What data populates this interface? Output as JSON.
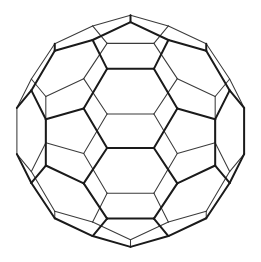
{
  "figure": {
    "name": "truncated-icosahedron-wireframe",
    "background_color": "#ffffff",
    "front_edge_color": "#1a1a1a",
    "back_edge_color": "#3b3b3b",
    "front_edge_width": 2.0,
    "back_edge_width": 1.05,
    "canvas": {
      "width": 261,
      "height": 262
    }
  },
  "geometry": {
    "solid": "truncated icosahedron",
    "vertex_count": 60,
    "edge_count": 90,
    "face_count": 32,
    "hexagon_faces": 20,
    "pentagon_faces": 12,
    "projection": "orthographic",
    "center": {
      "x": 130.5,
      "y": 131.0
    },
    "radius": 116.0,
    "rotation_x_deg": -3.0,
    "rotation_y_deg": 0.0,
    "rotation_z_deg": 0.0
  }
}
